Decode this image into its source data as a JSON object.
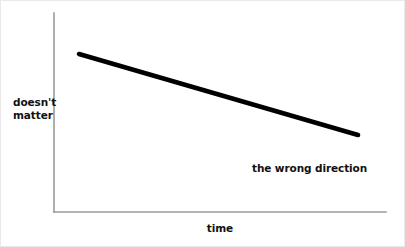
{
  "chart_data": {
    "type": "line",
    "title": "",
    "subtitle": "",
    "xlabel": "time",
    "ylabel": "doesn't matter",
    "ylabel_lines": [
      "doesn't",
      "matter"
    ],
    "grid": false,
    "legend": "none",
    "xlim": [
      0,
      100
    ],
    "ylim": [
      0,
      100
    ],
    "x_tick_labels": [],
    "y_tick_labels": [],
    "annotations": [
      {
        "text": "the wrong direction",
        "x": 60,
        "y": 24
      }
    ],
    "series": [
      {
        "name": "trend",
        "color": "#000000",
        "x": [
          7,
          100
        ],
        "y": [
          80,
          39
        ],
        "points": [
          {
            "x": 7,
            "y": 80
          },
          {
            "x": 100,
            "y": 39
          }
        ]
      }
    ]
  },
  "geometry": {
    "axis_color": "#9a9a9a",
    "line_color": "#000000",
    "background": "#ffffff",
    "border_color": "#e9e9e9",
    "y_axis": {
      "x": 53,
      "y_top": 12,
      "y_bottom": 211
    },
    "x_axis": {
      "y": 211,
      "x_left": 53,
      "x_right": 385
    },
    "data_line": {
      "x1": 78,
      "y1": 53,
      "x2": 357,
      "y2": 134
    }
  }
}
